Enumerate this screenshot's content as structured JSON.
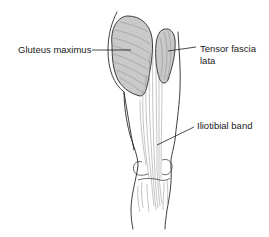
{
  "figure": {
    "type": "anatomical-illustration",
    "labels": {
      "gluteus_maximus": "Gluteus maximus",
      "tensor_fascia_lata_line1": "Tensor fascia",
      "tensor_fascia_lata_line2": "lata",
      "iliotibial_band": "Iliotibial band"
    },
    "colors": {
      "muscle_fill": "#c9c9c9",
      "outline": "#2a2a2a",
      "fiber": "#8a8a8a",
      "label_text": "#1a1a1a"
    }
  }
}
